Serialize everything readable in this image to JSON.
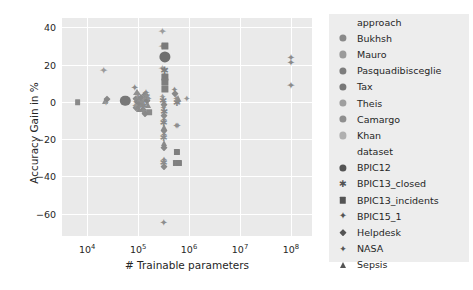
{
  "chart": {
    "type": "scatter",
    "title": "",
    "xlabel": "# Trainable parameters",
    "ylabel": "Accuracy Gain in %",
    "xscale": "log",
    "xlim": [
      3200,
      260000000
    ],
    "ylim": [
      -72,
      45
    ],
    "xticks": [
      {
        "mantissa": "10",
        "exp": "4",
        "value": 10000
      },
      {
        "mantissa": "10",
        "exp": "5",
        "value": 100000
      },
      {
        "mantissa": "10",
        "exp": "6",
        "value": 1000000
      },
      {
        "mantissa": "10",
        "exp": "7",
        "value": 10000000
      },
      {
        "mantissa": "10",
        "exp": "8",
        "value": 100000000
      }
    ],
    "yticks": [
      {
        "label": "40",
        "value": 40
      },
      {
        "label": "20",
        "value": 20
      },
      {
        "label": "0",
        "value": 0
      },
      {
        "label": "−20",
        "value": -20
      },
      {
        "label": "−40",
        "value": -40
      },
      {
        "label": "−60",
        "value": -60
      }
    ],
    "grid": true,
    "legend_position": "right",
    "plot_bg": "#eaeaea",
    "grid_color": "#ffffff",
    "text_color": "#262626"
  },
  "legend": {
    "approach": {
      "title": "approach",
      "items": [
        {
          "label": "Bukhsh",
          "color": "#8a8a8a",
          "marker": "circle"
        },
        {
          "label": "Mauro",
          "color": "#9a9a9a",
          "marker": "circle"
        },
        {
          "label": "Pasquadibisceglie",
          "color": "#7d7d7d",
          "marker": "circle"
        },
        {
          "label": "Tax",
          "color": "#777777",
          "marker": "circle"
        },
        {
          "label": "Theis",
          "color": "#9f9f9f",
          "marker": "circle"
        },
        {
          "label": "Camargo",
          "color": "#8f8f8f",
          "marker": "circle"
        },
        {
          "label": "Khan",
          "color": "#b0b0b0",
          "marker": "circle"
        }
      ]
    },
    "dataset": {
      "title": "dataset",
      "items": [
        {
          "label": "BPIC12",
          "marker": "circle"
        },
        {
          "label": "BPIC13_closed",
          "marker": "star"
        },
        {
          "label": "BPIC13_incidents",
          "marker": "square"
        },
        {
          "label": "BPIC15_1",
          "marker": "plus-filled"
        },
        {
          "label": "Helpdesk",
          "marker": "diamond"
        },
        {
          "label": "NASA",
          "marker": "plus"
        },
        {
          "label": "Sepsis",
          "marker": "triangle"
        }
      ]
    }
  },
  "chart_data": {
    "type": "scatter",
    "title": "",
    "xlabel": "# Trainable parameters",
    "ylabel": "Accuracy Gain in %",
    "xscale": "log",
    "xlim": [
      3200,
      260000000
    ],
    "ylim": [
      -72,
      45
    ],
    "grid": true,
    "legend_position": "right",
    "approach_categories": [
      "Bukhsh",
      "Mauro",
      "Pasquadibisceglie",
      "Tax",
      "Theis",
      "Camargo",
      "Khan"
    ],
    "dataset_categories": [
      "BPIC12",
      "BPIC13_closed",
      "BPIC13_incidents",
      "BPIC15_1",
      "Helpdesk",
      "NASA",
      "Sepsis"
    ],
    "points": [
      {
        "x": 6500,
        "y": 0,
        "marker": "square",
        "color": "#8a8a8a",
        "size": 3.2
      },
      {
        "x": 22000,
        "y": 0.5,
        "marker": "triangle",
        "color": "#8f8f8f",
        "size": 3.6
      },
      {
        "x": 23500,
        "y": -0.5,
        "marker": "plus",
        "color": "#9a9a9a",
        "size": 3.6
      },
      {
        "x": 24500,
        "y": 1.5,
        "marker": "diamond",
        "color": "#888888",
        "size": 3.2
      },
      {
        "x": 21000,
        "y": 17,
        "marker": "plus",
        "color": "#9b9b9b",
        "size": 4.2
      },
      {
        "x": 56000,
        "y": 0.5,
        "marker": "circle",
        "color": "#787878",
        "size": 5.2
      },
      {
        "x": 86000,
        "y": 7.5,
        "marker": "plus",
        "color": "#8a8a8a",
        "size": 4.0
      },
      {
        "x": 93000,
        "y": 5.5,
        "marker": "triangle",
        "color": "#909090",
        "size": 4.0
      },
      {
        "x": 90000,
        "y": 1.5,
        "marker": "diamond",
        "color": "#878787",
        "size": 3.6
      },
      {
        "x": 95000,
        "y": 0.5,
        "marker": "star",
        "color": "#8c8c8c",
        "size": 3.8
      },
      {
        "x": 99000,
        "y": 2.5,
        "marker": "plus",
        "color": "#969696",
        "size": 3.8
      },
      {
        "x": 101000,
        "y": -0.5,
        "marker": "diamond",
        "color": "#848484",
        "size": 3.6
      },
      {
        "x": 104000,
        "y": 1.0,
        "marker": "triangle",
        "color": "#8d8d8d",
        "size": 3.6
      },
      {
        "x": 97000,
        "y": -2.5,
        "marker": "plus",
        "color": "#919191",
        "size": 3.8
      },
      {
        "x": 92000,
        "y": -3.5,
        "marker": "diamond",
        "color": "#8b8b8b",
        "size": 3.6
      },
      {
        "x": 108000,
        "y": -1.5,
        "marker": "star",
        "color": "#888888",
        "size": 3.8
      },
      {
        "x": 112000,
        "y": 0.5,
        "marker": "plus",
        "color": "#939393",
        "size": 3.8
      },
      {
        "x": 115000,
        "y": 2.0,
        "marker": "diamond",
        "color": "#8a8a8a",
        "size": 3.6
      },
      {
        "x": 118000,
        "y": -1.0,
        "marker": "triangle",
        "color": "#8e8e8e",
        "size": 3.6
      },
      {
        "x": 122000,
        "y": 0.0,
        "marker": "plus",
        "color": "#8f8f8f",
        "size": 3.8
      },
      {
        "x": 125000,
        "y": -4.5,
        "marker": "diamond",
        "color": "#898989",
        "size": 3.6
      },
      {
        "x": 130000,
        "y": -2.0,
        "marker": "star",
        "color": "#8c8c8c",
        "size": 3.8
      },
      {
        "x": 134000,
        "y": 1.0,
        "marker": "plus",
        "color": "#949494",
        "size": 3.8
      },
      {
        "x": 138000,
        "y": 3.5,
        "marker": "diamond",
        "color": "#878787",
        "size": 3.6
      },
      {
        "x": 142000,
        "y": 5.0,
        "marker": "plus",
        "color": "#8b8b8b",
        "size": 4.0
      },
      {
        "x": 146000,
        "y": 2.5,
        "marker": "star",
        "color": "#909090",
        "size": 3.8
      },
      {
        "x": 150000,
        "y": 0.5,
        "marker": "diamond",
        "color": "#868686",
        "size": 3.6
      },
      {
        "x": 155000,
        "y": -1.5,
        "marker": "triangle",
        "color": "#8d8d8d",
        "size": 3.6
      },
      {
        "x": 160000,
        "y": 1.5,
        "marker": "plus",
        "color": "#929292",
        "size": 3.8
      },
      {
        "x": 164000,
        "y": -5.5,
        "marker": "square",
        "color": "#8a8a8a",
        "size": 3.2
      },
      {
        "x": 136000,
        "y": -6.5,
        "marker": "diamond",
        "color": "#888888",
        "size": 3.6
      },
      {
        "x": 128000,
        "y": -5.0,
        "marker": "plus",
        "color": "#8e8e8e",
        "size": 3.8
      },
      {
        "x": 106000,
        "y": -4.0,
        "marker": "triangle",
        "color": "#8b8b8b",
        "size": 3.6
      },
      {
        "x": 88000,
        "y": -2.0,
        "marker": "plus",
        "color": "#959595",
        "size": 3.8
      },
      {
        "x": 300000,
        "y": 38,
        "marker": "plus",
        "color": "#9c9c9c",
        "size": 4.2
      },
      {
        "x": 300000,
        "y": 30,
        "marker": "plus",
        "color": "#a0a0a0",
        "size": 4.2
      },
      {
        "x": 330000,
        "y": 30,
        "marker": "square",
        "color": "#7a7a7a",
        "size": 4.0
      },
      {
        "x": 330000,
        "y": 24,
        "marker": "circle",
        "color": "#6f6f6f",
        "size": 5.6
      },
      {
        "x": 300000,
        "y": 18,
        "marker": "plus",
        "color": "#a2a2a2",
        "size": 4.2
      },
      {
        "x": 330000,
        "y": 17,
        "marker": "star",
        "color": "#7f7f7f",
        "size": 4.0
      },
      {
        "x": 330000,
        "y": 13.5,
        "marker": "square",
        "color": "#7c7c7c",
        "size": 4.0
      },
      {
        "x": 330000,
        "y": 10.5,
        "marker": "square",
        "color": "#7e7e7e",
        "size": 4.0
      },
      {
        "x": 330000,
        "y": 7,
        "marker": "square",
        "color": "#808080",
        "size": 4.0
      },
      {
        "x": 300000,
        "y": 2.5,
        "marker": "plus",
        "color": "#9a9a9a",
        "size": 3.8
      },
      {
        "x": 310000,
        "y": 0.5,
        "marker": "star",
        "color": "#888888",
        "size": 3.8
      },
      {
        "x": 320000,
        "y": -1.5,
        "marker": "diamond",
        "color": "#8a8a8a",
        "size": 3.6
      },
      {
        "x": 315000,
        "y": -3.5,
        "marker": "plus",
        "color": "#8f8f8f",
        "size": 3.8
      },
      {
        "x": 325000,
        "y": -5.5,
        "marker": "star",
        "color": "#868686",
        "size": 3.8
      },
      {
        "x": 318000,
        "y": -7.5,
        "marker": "diamond",
        "color": "#8c8c8c",
        "size": 3.6
      },
      {
        "x": 322000,
        "y": -9.5,
        "marker": "plus",
        "color": "#919191",
        "size": 3.8
      },
      {
        "x": 316000,
        "y": -11.5,
        "marker": "star",
        "color": "#878787",
        "size": 3.8
      },
      {
        "x": 324000,
        "y": -13.5,
        "marker": "triangle",
        "color": "#8d8d8d",
        "size": 3.6
      },
      {
        "x": 318000,
        "y": -15.5,
        "marker": "diamond",
        "color": "#898989",
        "size": 3.6
      },
      {
        "x": 322000,
        "y": -17.5,
        "marker": "plus",
        "color": "#8b8b8b",
        "size": 3.8
      },
      {
        "x": 316000,
        "y": -19.5,
        "marker": "star",
        "color": "#8e8e8e",
        "size": 3.8
      },
      {
        "x": 320000,
        "y": -22,
        "marker": "triangle",
        "color": "#8a8a8a",
        "size": 3.6
      },
      {
        "x": 318000,
        "y": -24.5,
        "marker": "diamond",
        "color": "#888888",
        "size": 3.6
      },
      {
        "x": 322000,
        "y": -31,
        "marker": "plus",
        "color": "#909090",
        "size": 3.8
      },
      {
        "x": 318000,
        "y": -33,
        "marker": "star",
        "color": "#8c8c8c",
        "size": 3.8
      },
      {
        "x": 320000,
        "y": -35,
        "marker": "diamond",
        "color": "#8a8a8a",
        "size": 3.6
      },
      {
        "x": 320000,
        "y": -65,
        "marker": "plus",
        "color": "#8d8d8d",
        "size": 4.0
      },
      {
        "x": 520000,
        "y": 6.5,
        "marker": "plus",
        "color": "#8b8b8b",
        "size": 3.8
      },
      {
        "x": 540000,
        "y": 4.0,
        "marker": "diamond",
        "color": "#888888",
        "size": 3.6
      },
      {
        "x": 560000,
        "y": 1.5,
        "marker": "plus",
        "color": "#929292",
        "size": 3.8
      },
      {
        "x": 580000,
        "y": -0.5,
        "marker": "star",
        "color": "#878787",
        "size": 3.8
      },
      {
        "x": 600000,
        "y": 2.0,
        "marker": "triangle",
        "color": "#8e8e8e",
        "size": 3.6
      },
      {
        "x": 620000,
        "y": 0.0,
        "marker": "plus",
        "color": "#8a8a8a",
        "size": 3.8
      },
      {
        "x": 560000,
        "y": -13,
        "marker": "plus",
        "color": "#8c8c8c",
        "size": 3.8
      },
      {
        "x": 600000,
        "y": -13,
        "marker": "plus",
        "color": "#909090",
        "size": 3.8
      },
      {
        "x": 580000,
        "y": -27,
        "marker": "square",
        "color": "#7f7f7f",
        "size": 3.4
      },
      {
        "x": 560000,
        "y": -33,
        "marker": "square",
        "color": "#818181",
        "size": 3.4
      },
      {
        "x": 600000,
        "y": -33,
        "marker": "square",
        "color": "#838383",
        "size": 3.4
      },
      {
        "x": 640000,
        "y": -33,
        "marker": "square",
        "color": "#808080",
        "size": 3.4
      },
      {
        "x": 900000,
        "y": 1.5,
        "marker": "plus",
        "color": "#959595",
        "size": 3.8
      },
      {
        "x": 100000000,
        "y": 23.5,
        "marker": "plus",
        "color": "#8d8d8d",
        "size": 4.0
      },
      {
        "x": 100000000,
        "y": 21,
        "marker": "plus",
        "color": "#8a8a8a",
        "size": 4.0
      },
      {
        "x": 100000000,
        "y": 9,
        "marker": "plus",
        "color": "#8c8c8c",
        "size": 4.2
      }
    ]
  }
}
